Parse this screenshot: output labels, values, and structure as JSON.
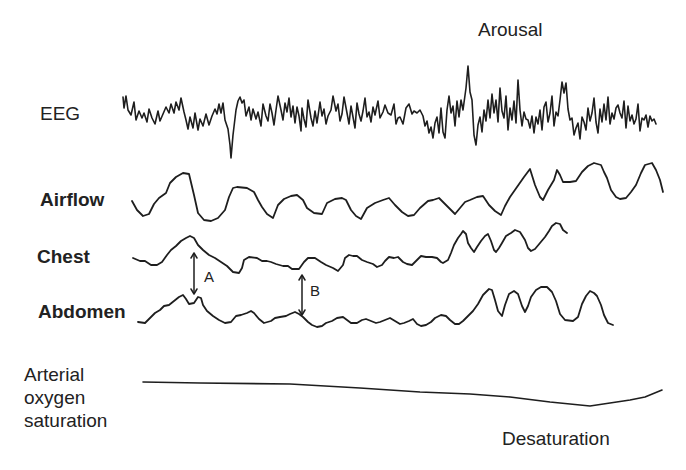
{
  "diagram": {
    "type": "polysomnography-trace",
    "channels": [
      {
        "id": "eeg",
        "label": "EEG"
      },
      {
        "id": "airflow",
        "label": "Airflow"
      },
      {
        "id": "chest",
        "label": "Chest"
      },
      {
        "id": "abdomen",
        "label": "Abdomen"
      },
      {
        "id": "spo2",
        "label_lines": [
          "Arterial",
          "oxygen",
          "saturation"
        ]
      }
    ],
    "annotations": {
      "arousal": "Arousal",
      "desaturation": "Desaturation",
      "marker_a": "A",
      "marker_b": "B"
    },
    "colors": {
      "background": "#ffffff",
      "trace": "#1e1e1e",
      "text": "#222222"
    }
  }
}
